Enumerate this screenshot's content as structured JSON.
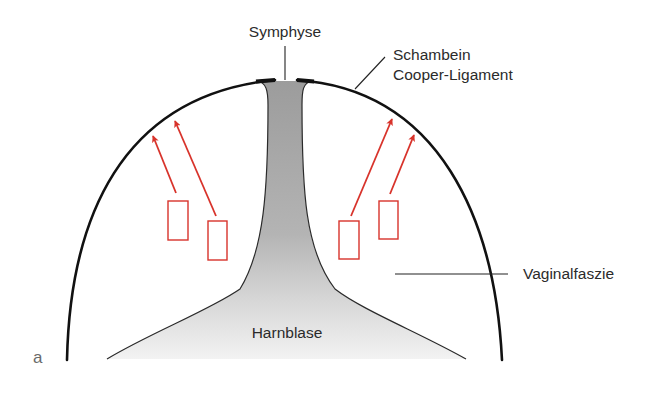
{
  "figure": {
    "panel_label": "a",
    "labels": {
      "symphyse": "Symphyse",
      "schambein": "Schambein",
      "cooper_ligament": "Cooper-Ligament",
      "vaginalfaszie": "Vaginalfaszie",
      "harnblase": "Harnblase"
    },
    "colors": {
      "arrow_red": "#d8332b",
      "outline": "#111111",
      "bladder_gray_top": "#9c9c9c",
      "bladder_gray_bottom": "#f3f3f3",
      "label_text": "#2b2b2b"
    },
    "arrows": [
      {
        "side": "left",
        "from": [
          176,
          193
        ],
        "to": [
          153,
          136
        ]
      },
      {
        "side": "left",
        "from": [
          216,
          216
        ],
        "to": [
          175,
          121
        ]
      },
      {
        "side": "right",
        "from": [
          351,
          216
        ],
        "to": [
          392,
          119
        ]
      },
      {
        "side": "right",
        "from": [
          390,
          194
        ],
        "to": [
          414,
          135
        ]
      }
    ],
    "boxes": [
      {
        "side": "left",
        "x": 168,
        "y": 201,
        "w": 20,
        "h": 39
      },
      {
        "side": "left",
        "x": 208,
        "y": 221,
        "w": 19,
        "h": 39
      },
      {
        "side": "right",
        "x": 339,
        "y": 221,
        "w": 20,
        "h": 38
      },
      {
        "side": "right",
        "x": 379,
        "y": 201,
        "w": 19,
        "h": 38
      }
    ]
  }
}
